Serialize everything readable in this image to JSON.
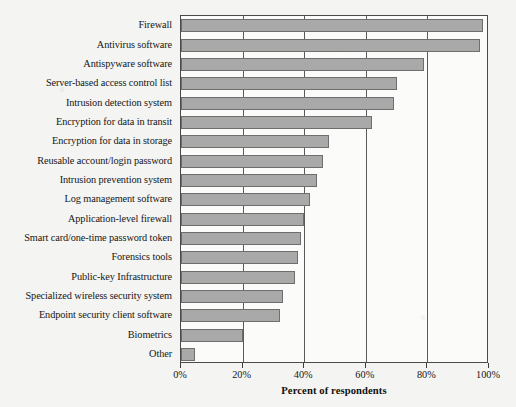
{
  "chart_data": {
    "type": "bar",
    "orientation": "horizontal",
    "title": "",
    "xlabel": "Percent of respondents",
    "ylabel": "",
    "xlim": [
      0,
      100
    ],
    "xticks": [
      "0%",
      "20%",
      "40%",
      "60%",
      "80%",
      "100%"
    ],
    "xtick_values": [
      0,
      20,
      40,
      60,
      80,
      100
    ],
    "grid": true,
    "legend": "none",
    "bar_color": "#a9a9a9",
    "bar_border_color": "#6e6e6e",
    "categories": [
      "Firewall",
      "Antivirus software",
      "Antispyware software",
      "Server-based access control list",
      "Intrusion detection system",
      "Encryption for data in transit",
      "Encryption for data in storage",
      "Reusable account/login password",
      "Intrusion prevention system",
      "Log management software",
      "Application-level firewall",
      "Smart card/one-time password token",
      "Forensics tools",
      "Public-key Infrastructure",
      "Specialized wireless security system",
      "Endpoint security client software",
      "Biometrics",
      "Other"
    ],
    "values": [
      98,
      97,
      79,
      70,
      69,
      62,
      48,
      46,
      44,
      42,
      40,
      39,
      38,
      37,
      33,
      32,
      20,
      4.5
    ]
  }
}
